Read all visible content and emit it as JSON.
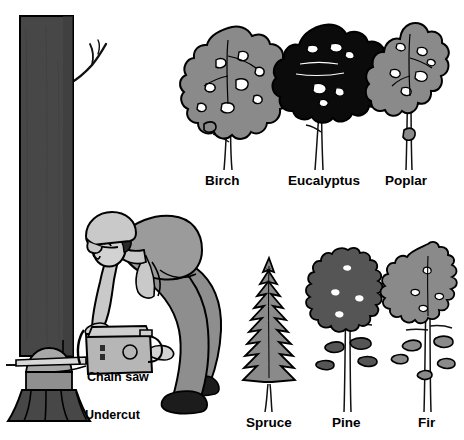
{
  "figure": {
    "background_color": "#ffffff"
  },
  "palette": {
    "ink": "#000000",
    "background": "#ffffff",
    "trunk_dark": "#474747",
    "trunk_shadow": "#3a3a3a",
    "undercut_face": "#a8a8a8",
    "undercut_lower": "#8f8f8f",
    "canopy_gray": "#8a8a8a",
    "canopy_black": "#0b0b0b",
    "pine_dark": "#555555",
    "fir_gray": "#8a8a8a",
    "skin": "#d2d2d2",
    "shirt": "#9b9b9b",
    "pants": "#8e8e8e",
    "helmet": "#c9c9c9",
    "hair": "#2b2b2b",
    "boot": "#1c1c1c",
    "saw_body": "#b6b6b6",
    "saw_top": "#cfcfcf"
  },
  "labels": {
    "chain_saw": "Chain saw",
    "undercut": "Undercut",
    "birch": "Birch",
    "eucalyptus": "Eucalyptus",
    "poplar": "Poplar",
    "spruce": "Spruce",
    "pine": "Pine",
    "fir": "Fir"
  },
  "scene": {
    "felling": {
      "name": "tree-felling-scene",
      "parts": [
        "standing-tree-trunk",
        "broken-branch",
        "undercut-wedge",
        "flared-stump-base",
        "logger-figure",
        "hard-hat",
        "chain-saw"
      ]
    },
    "deciduous_row": {
      "name": "deciduous-tree-row",
      "trees": [
        {
          "key": "birch",
          "label": "Birch",
          "canopy": "lobed-gray",
          "trunks": 2
        },
        {
          "key": "eucalyptus",
          "label": "Eucalyptus",
          "canopy": "billowy-black",
          "trunks": 2
        },
        {
          "key": "poplar",
          "label": "Poplar",
          "canopy": "narrow-upright-gray",
          "trunks": 1
        }
      ]
    },
    "conifer_row": {
      "name": "conifer-tree-row",
      "trees": [
        {
          "key": "spruce",
          "label": "Spruce",
          "canopy": "spiky-narrow-cone",
          "trunks": 1
        },
        {
          "key": "pine",
          "label": "Pine",
          "canopy": "layered-dark-clusters",
          "trunks": 2
        },
        {
          "key": "fir",
          "label": "Fir",
          "canopy": "open-layered-gray",
          "trunks": 2
        }
      ]
    }
  }
}
